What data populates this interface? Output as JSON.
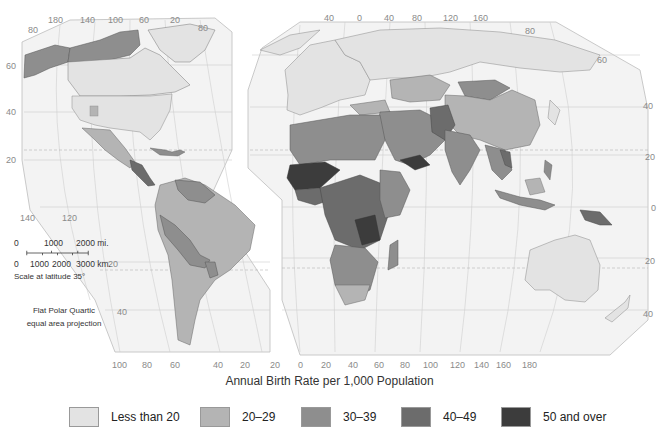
{
  "map": {
    "title": "Annual Birth Rate per 1,000 Population",
    "projection": "Flat Polar Quartic\nequal area projection",
    "projection_lines": [
      "Flat Polar Quartic",
      "equal area projection"
    ],
    "scale": {
      "miles_labels": [
        "0",
        "1000",
        "2000 mi."
      ],
      "km_labels": [
        "0",
        "1000",
        "2000",
        "3000 km."
      ],
      "caption": "Scale at latitude 35°"
    },
    "ticks": {
      "americas_top": [
        "180",
        "140",
        "100",
        "60",
        "20"
      ],
      "americas_left_lat": [
        "80",
        "60",
        "40",
        "20"
      ],
      "americas_bottom_upper": [
        "140",
        "120"
      ],
      "americas_lower_lat": [
        "20",
        "40"
      ],
      "americas_bottom": [
        "100",
        "80",
        "60",
        "40",
        "20"
      ],
      "americas_top_right_lat": "80",
      "eurasia_top": [
        "40",
        "0",
        "40",
        "80",
        "120",
        "160"
      ],
      "eurasia_right_lat": [
        "80",
        "60",
        "40",
        "20",
        "0",
        "20",
        "40"
      ],
      "eurasia_bottom": [
        "20",
        "0",
        "20",
        "40",
        "60",
        "80",
        "100",
        "120",
        "140",
        "160",
        "180"
      ]
    }
  },
  "legend": {
    "items": [
      {
        "label": "Less than 20",
        "color": "#e3e3e3"
      },
      {
        "label": "20–29",
        "color": "#b4b4b4"
      },
      {
        "label": "30–39",
        "color": "#8e8e8e"
      },
      {
        "label": "40–49",
        "color": "#6c6c6c"
      },
      {
        "label": "50 and over",
        "color": "#3c3c3c"
      }
    ]
  },
  "colors": {
    "ocean": "#f3f3f3",
    "graticule": "#c8c8c8",
    "border": "#555555",
    "tropic_dash": "#b0b0b0"
  }
}
